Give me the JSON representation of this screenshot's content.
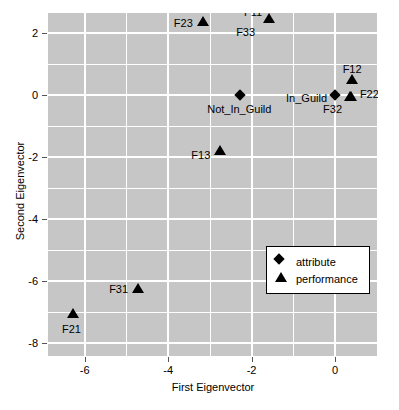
{
  "chart_data": {
    "type": "scatter",
    "title": "",
    "xlabel": "First Eigenvector",
    "ylabel": "Second Eigenvector",
    "xlim": [
      -6.88,
      1.03
    ],
    "ylim": [
      -8.42,
      2.64
    ],
    "xticks": [
      -6,
      -4,
      -2,
      0
    ],
    "xticklabels": [
      "-6",
      "-4",
      "-2",
      "0"
    ],
    "yticks": [
      2,
      0,
      -2,
      -4,
      -6,
      -8
    ],
    "yticklabels": [
      "2",
      "0",
      "-2",
      "-4",
      "-6",
      "-8"
    ],
    "grid": true,
    "grid_color": "#ffffff",
    "panel_background": "#c6c6c6",
    "marker_color": "#000000",
    "legend": {
      "position": "inside-lower-right",
      "entries": [
        {
          "label": "attribute",
          "marker": "diamond"
        },
        {
          "label": "performance",
          "marker": "triangle"
        }
      ]
    },
    "series": [
      {
        "name": "attribute",
        "marker": "diamond",
        "points": [
          {
            "label": "Not_In_Guild",
            "x": -2.27,
            "y": 0.0,
            "label_dx": -1,
            "label_dy": 15,
            "label_anchor": "middle"
          },
          {
            "label": "In_Guild",
            "x": 0.0,
            "y": 0.0,
            "label_dx": -8,
            "label_dy": 4,
            "label_anchor": "end"
          }
        ]
      },
      {
        "name": "performance",
        "marker": "triangle",
        "points": [
          {
            "label": "F23",
            "x": -3.17,
            "y": 2.38,
            "label_dx": -10,
            "label_dy": 3,
            "label_anchor": "end"
          },
          {
            "label": "F11",
            "x": -1.58,
            "y": 2.48,
            "label_dx": -7,
            "label_dy": -5,
            "label_anchor": "end"
          },
          {
            "label": "F33",
            "x": -1.58,
            "y": 2.48,
            "label_dx": -14,
            "label_dy": 15,
            "label_anchor": "end"
          },
          {
            "label": "F12",
            "x": 0.41,
            "y": 0.52,
            "label_dx": 0,
            "label_dy": -9,
            "label_anchor": "middle"
          },
          {
            "label": "F22",
            "x": 0.38,
            "y": -0.03,
            "label_dx": 9,
            "label_dy": -1,
            "label_anchor": "start"
          },
          {
            "label": "F32",
            "x": 0.36,
            "y": -0.05,
            "label_dx": -8,
            "label_dy": 14,
            "label_anchor": "end"
          },
          {
            "label": "F13",
            "x": -2.75,
            "y": -1.77,
            "label_dx": -10,
            "label_dy": 6,
            "label_anchor": "end"
          },
          {
            "label": "F31",
            "x": -4.72,
            "y": -6.24,
            "label_dx": -10,
            "label_dy": 2,
            "label_anchor": "end"
          },
          {
            "label": "F21",
            "x": -6.27,
            "y": -7.04,
            "label_dx": -2,
            "label_dy": 17,
            "label_anchor": "middle"
          }
        ]
      }
    ]
  }
}
